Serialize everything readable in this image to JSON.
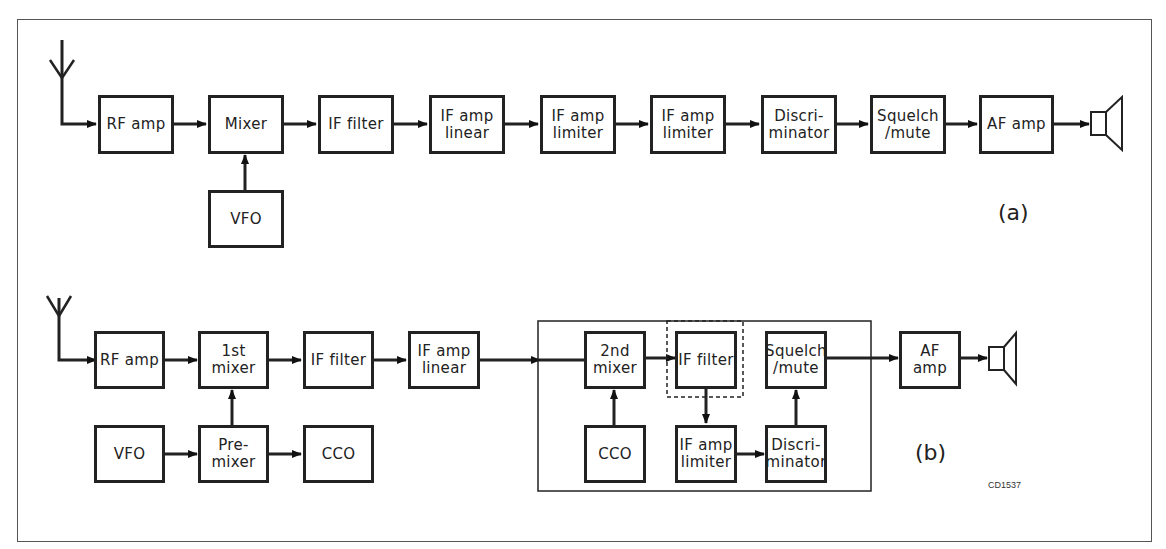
{
  "diagram_a": {
    "label": "(a)",
    "blocks": [
      {
        "id": "rf_amp",
        "l1": "RF amp",
        "l2": ""
      },
      {
        "id": "mixer",
        "l1": "Mixer",
        "l2": ""
      },
      {
        "id": "if_filter",
        "l1": "IF filter",
        "l2": ""
      },
      {
        "id": "if_amp_linear",
        "l1": "IF amp",
        "l2": "linear"
      },
      {
        "id": "if_amp_limiter_1",
        "l1": "IF amp",
        "l2": "limiter"
      },
      {
        "id": "if_amp_limiter_2",
        "l1": "IF amp",
        "l2": "limiter"
      },
      {
        "id": "discriminator",
        "l1": "Discri-",
        "l2": "minator"
      },
      {
        "id": "squelch",
        "l1": "Squelch",
        "l2": "/mute"
      },
      {
        "id": "af_amp",
        "l1": "AF amp",
        "l2": ""
      },
      {
        "id": "vfo",
        "l1": "VFO",
        "l2": ""
      }
    ]
  },
  "diagram_b": {
    "label": "(b)",
    "blocks": [
      {
        "id": "rf_amp",
        "l1": "RF amp",
        "l2": ""
      },
      {
        "id": "first_mixer",
        "l1": "1st",
        "l2": "mixer"
      },
      {
        "id": "if_filter",
        "l1": "IF filter",
        "l2": ""
      },
      {
        "id": "if_amp_linear",
        "l1": "IF amp",
        "l2": "linear"
      },
      {
        "id": "vfo",
        "l1": "VFO",
        "l2": ""
      },
      {
        "id": "premixer",
        "l1": "Pre-",
        "l2": "mixer"
      },
      {
        "id": "cco",
        "l1": "CCO",
        "l2": ""
      },
      {
        "id": "second_mixer",
        "l1": "2nd",
        "l2": "mixer"
      },
      {
        "id": "if_filter_2",
        "l1": "IF filter",
        "l2": ""
      },
      {
        "id": "squelch",
        "l1": "Squelch",
        "l2": "/mute"
      },
      {
        "id": "cco_2",
        "l1": "CCO",
        "l2": ""
      },
      {
        "id": "if_amp_limiter",
        "l1": "IF amp",
        "l2": "limiter"
      },
      {
        "id": "discriminator",
        "l1": "Discri-",
        "l2": "minator"
      },
      {
        "id": "af_amp",
        "l1": "AF amp",
        "l2": ""
      }
    ]
  },
  "figure_code": "CD1537"
}
